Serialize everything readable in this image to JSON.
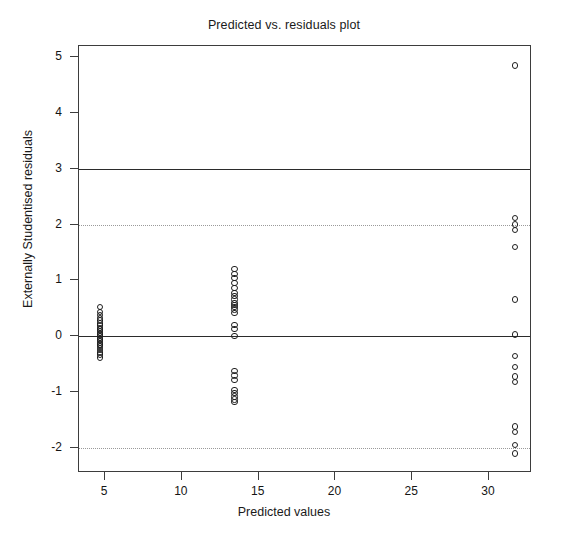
{
  "chart_data": {
    "type": "scatter",
    "title": "Predicted vs. residuals plot",
    "xlabel": "Predicted values",
    "ylabel": "Externally Studentised residuals",
    "xlim": [
      3.3,
      32.8
    ],
    "ylim": [
      -2.45,
      5.2
    ],
    "xticks": [
      5,
      10,
      15,
      20,
      25,
      30
    ],
    "xticklabels": [
      "5",
      "10",
      "15",
      "20",
      "25",
      "30"
    ],
    "yticks": [
      -2,
      -1,
      0,
      1,
      2,
      3,
      4,
      5
    ],
    "yticklabels": [
      "-2",
      "-1",
      "0",
      "1",
      "2",
      "3",
      "4",
      "5"
    ],
    "grid": false,
    "legend": null,
    "marker": "open-circle",
    "marker_color": "#1f1f1f",
    "reference_lines": [
      {
        "y": 3,
        "style": "solid",
        "color": "#2b2b2b"
      },
      {
        "y": 2,
        "style": "dotted",
        "color": "#9a9a9a"
      },
      {
        "y": 0,
        "style": "solid",
        "color": "#2b2b2b"
      },
      {
        "y": -2,
        "style": "dotted",
        "color": "#9a9a9a"
      }
    ],
    "series": [
      {
        "name": "residuals",
        "x": [
          4.68,
          4.68,
          4.68,
          4.68,
          4.68,
          4.68,
          4.68,
          4.68,
          4.68,
          4.68,
          4.68,
          4.68,
          4.68,
          4.68,
          4.68,
          4.68,
          4.68,
          4.68,
          4.68,
          4.68,
          4.68,
          4.68,
          4.68,
          4.68,
          13.42,
          13.42,
          13.42,
          13.42,
          13.42,
          13.42,
          13.42,
          13.42,
          13.42,
          13.42,
          13.42,
          13.42,
          13.42,
          13.42,
          13.42,
          13.42,
          13.42,
          13.42,
          13.42,
          13.42,
          13.42,
          13.42,
          13.42,
          13.42,
          31.7,
          31.7,
          31.7,
          31.7,
          31.7,
          31.7,
          31.7,
          31.7,
          31.7,
          31.7,
          31.7,
          31.7,
          31.7,
          31.7,
          31.7
        ],
        "y": [
          0.52,
          0.44,
          0.38,
          0.33,
          0.28,
          0.23,
          0.19,
          0.15,
          0.12,
          0.09,
          0.06,
          0.03,
          0.0,
          -0.03,
          -0.06,
          -0.09,
          -0.12,
          -0.15,
          -0.18,
          -0.21,
          -0.25,
          -0.29,
          -0.33,
          -0.38,
          1.2,
          1.12,
          1.04,
          0.95,
          0.86,
          0.78,
          0.72,
          0.66,
          0.6,
          0.56,
          0.52,
          0.2,
          0.13,
          0.0,
          -0.62,
          -0.7,
          -0.78,
          -0.96,
          -1.02,
          -1.08,
          -1.13,
          -1.18,
          0.48,
          0.42,
          4.85,
          2.12,
          2.0,
          1.9,
          1.6,
          0.66,
          0.03,
          -0.35,
          -0.55,
          -0.72,
          -0.82,
          -1.62,
          -1.72,
          -1.95,
          -2.1
        ]
      }
    ]
  }
}
